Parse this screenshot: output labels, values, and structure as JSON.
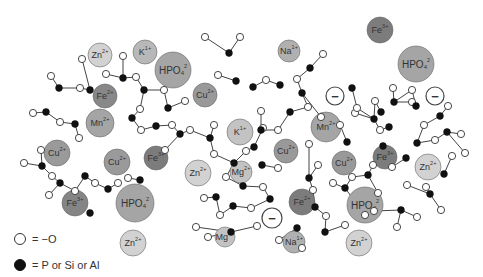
{
  "legend": {
    "open_circle_label": "= −O",
    "filled_circle_label": "= P or Si or Al"
  },
  "ions": [
    {
      "id": "zn1",
      "label": "Zn",
      "charge": "2+",
      "x": 100,
      "y": 55,
      "r": 12,
      "fill": "#d2d2d2"
    },
    {
      "id": "k1",
      "label": "K",
      "charge": "1+",
      "x": 145,
      "y": 52,
      "r": 12,
      "fill": "#b8b8b8"
    },
    {
      "id": "hpo1",
      "label": "HPO",
      "sub": "4",
      "charge": "2",
      "x": 173,
      "y": 70,
      "r": 18,
      "fill": "#a5a5a5"
    },
    {
      "id": "fe1",
      "label": "Fe",
      "charge": "2+",
      "x": 105,
      "y": 96,
      "r": 12,
      "fill": "#888"
    },
    {
      "id": "mn1",
      "label": "Mn",
      "charge": "2+",
      "x": 100,
      "y": 123,
      "r": 14,
      "fill": "#a5a5a5"
    },
    {
      "id": "cu1",
      "label": "Cu",
      "charge": "2+",
      "x": 205,
      "y": 95,
      "r": 12,
      "fill": "#999"
    },
    {
      "id": "na1",
      "label": "Na",
      "charge": "1+",
      "x": 289,
      "y": 51,
      "r": 11,
      "fill": "#b0b0b0"
    },
    {
      "id": "fe2",
      "label": "Fe",
      "charge": "3+",
      "x": 380,
      "y": 30,
      "r": 13,
      "fill": "#7c7c7c"
    },
    {
      "id": "hpo2",
      "label": "HPO",
      "sub": "4",
      "charge": "2",
      "x": 416,
      "y": 64,
      "r": 18,
      "fill": "#a5a5a5"
    },
    {
      "id": "minus1",
      "label": "−",
      "charge": "",
      "x": 335,
      "y": 96,
      "r": 9,
      "fill": "#fff",
      "stroke": "#444"
    },
    {
      "id": "minus2",
      "label": "−",
      "charge": "",
      "x": 435,
      "y": 96,
      "r": 9,
      "fill": "#fff",
      "stroke": "#444"
    },
    {
      "id": "k2",
      "label": "K",
      "charge": "1+",
      "x": 240,
      "y": 132,
      "r": 13,
      "fill": "#c3c3c3"
    },
    {
      "id": "mn2",
      "label": "Mn",
      "charge": "2+",
      "x": 326,
      "y": 127,
      "r": 15,
      "fill": "#a5a5a5"
    },
    {
      "id": "cu2",
      "label": "Cu",
      "charge": "2+",
      "x": 57,
      "y": 153,
      "r": 13,
      "fill": "#9a9a9a"
    },
    {
      "id": "cu3",
      "label": "Cu",
      "charge": "2+",
      "x": 117,
      "y": 162,
      "r": 13,
      "fill": "#9a9a9a"
    },
    {
      "id": "fe3",
      "label": "Fe",
      "charge": "3+",
      "x": 156,
      "y": 158,
      "r": 12,
      "fill": "#7c7c7c"
    },
    {
      "id": "zn2",
      "label": "Zn",
      "charge": "2+",
      "x": 198,
      "y": 173,
      "r": 13,
      "fill": "#d2d2d2"
    },
    {
      "id": "mg1",
      "label": "Mg",
      "charge": "2+",
      "x": 241,
      "y": 172,
      "r": 11,
      "fill": "#c3c3c3"
    },
    {
      "id": "cu4",
      "label": "Cu",
      "charge": "2+",
      "x": 286,
      "y": 151,
      "r": 12,
      "fill": "#999"
    },
    {
      "id": "cu5",
      "label": "Cu",
      "charge": "2+",
      "x": 344,
      "y": 163,
      "r": 12,
      "fill": "#999"
    },
    {
      "id": "fe4",
      "label": "Fe",
      "charge": "3+",
      "x": 385,
      "y": 157,
      "r": 12,
      "fill": "#7c7c7c"
    },
    {
      "id": "zn3",
      "label": "Zn",
      "charge": "2+",
      "x": 428,
      "y": 167,
      "r": 13,
      "fill": "#d2d2d2"
    },
    {
      "id": "fe5",
      "label": "Fe",
      "charge": "3+",
      "x": 75,
      "y": 203,
      "r": 13,
      "fill": "#858585"
    },
    {
      "id": "hpo3",
      "label": "HPO",
      "sub": "4",
      "charge": "2",
      "x": 135,
      "y": 203,
      "r": 19,
      "fill": "#a5a5a5"
    },
    {
      "id": "fe6",
      "label": "Fe",
      "charge": "2+",
      "x": 302,
      "y": 202,
      "r": 13,
      "fill": "#7c7c7c"
    },
    {
      "id": "hpo4",
      "label": "HPO",
      "sub": "4",
      "charge": "2",
      "x": 365,
      "y": 205,
      "r": 18,
      "fill": "#a5a5a5"
    },
    {
      "id": "minus3",
      "label": "−",
      "charge": "",
      "x": 272,
      "y": 218,
      "r": 10,
      "fill": "#fff",
      "stroke": "#444"
    },
    {
      "id": "zn4",
      "label": "Zn",
      "charge": "2+",
      "x": 133,
      "y": 243,
      "r": 13,
      "fill": "#d2d2d2"
    },
    {
      "id": "mg2",
      "label": "Mg",
      "charge": "2+",
      "x": 225,
      "y": 237,
      "r": 10,
      "fill": "#c3c3c3"
    },
    {
      "id": "na2",
      "label": "Na",
      "charge": "1+",
      "x": 294,
      "y": 242,
      "r": 11,
      "fill": "#b0b0b0"
    },
    {
      "id": "zn5",
      "label": "Zn",
      "charge": "2+",
      "x": 359,
      "y": 243,
      "r": 13,
      "fill": "#d2d2d2"
    }
  ]
}
